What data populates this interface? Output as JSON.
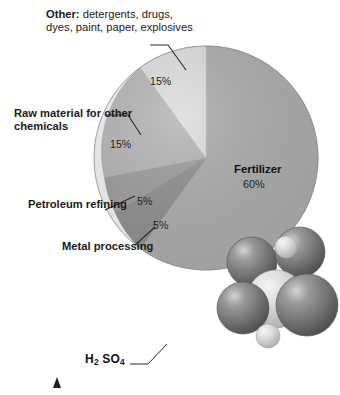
{
  "figure": {
    "caption_formula": "H2SO4",
    "formula_parts": [
      {
        "t": "H",
        "sub": false
      },
      {
        "t": "2",
        "sub": true
      },
      {
        "t": " SO",
        "sub": false
      },
      {
        "t": "4",
        "sub": true
      }
    ],
    "molecule_name": "sulfuric-acid-space-filling-model"
  },
  "colors": {
    "fertilizer": "#ababab",
    "metal_processing": "#8f8f8f",
    "petroleum_refining": "#9c9c9c",
    "raw_material": "#b4b4b4",
    "other": "#dcdcdc",
    "outline": "#8a8a8a",
    "leader_line": "#2b2b2b",
    "text": "#1a1a1a",
    "molecule_dark": "#6e6e6e",
    "molecule_light": "#d8d8d8"
  },
  "labels": {
    "other": {
      "head": "Other:",
      "body": " detergents, drugs, dyes, paint, paper, explosives"
    },
    "raw_material": "Raw material for other chemicals",
    "petroleum": "Petroleum refining",
    "metal": "Metal processing",
    "fertilizer_name": "Fertilizer"
  },
  "chart_data": {
    "type": "pie",
    "title": "",
    "categories": [
      "Fertilizer",
      "Metal processing",
      "Petroleum refining",
      "Raw material for other chemicals",
      "Other: detergents, drugs, dyes, paint, paper, explosives"
    ],
    "values": [
      60,
      15,
      15,
      5,
      5
    ],
    "slices": [
      {
        "label": "Fertilizer",
        "value": 60,
        "display": "60%",
        "color": "#ababab"
      },
      {
        "label": "Metal processing",
        "value": 5,
        "display": "5%",
        "color": "#8f8f8f"
      },
      {
        "label": "Petroleum refining",
        "value": 5,
        "display": "5%",
        "color": "#9c9c9c"
      },
      {
        "label": "Raw material for other chemicals",
        "value": 15,
        "display": "15%",
        "color": "#b4b4b4"
      },
      {
        "label": "Other: detergents, drugs, dyes, paint, paper, explosives",
        "value": 15,
        "display": "15%",
        "color": "#dcdcdc"
      }
    ],
    "unit": "%",
    "legend": "none",
    "grid": false,
    "start_angle_deg": 0,
    "direction": "clockwise"
  },
  "percent_text": {
    "fertilizer": "60%",
    "metal": "5%",
    "petroleum": "5%",
    "raw": "15%",
    "other": "15%"
  }
}
